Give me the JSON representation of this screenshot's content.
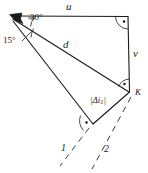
{
  "figure": {
    "background_color": "#ffffff",
    "ink_color": "#1a1a1a",
    "width": 148,
    "height": 173,
    "labels": {
      "u": "u",
      "v": "v",
      "d": "d",
      "K": "K",
      "angle_30": "30°",
      "angle_15": "15°",
      "delta_i": "|Δi",
      "delta_i_sub": "1",
      "delta_i_close": "|",
      "ray_1": "1",
      "ray_2": "2"
    },
    "markers": {
      "right_angle_top_right": "right-angle-arc-with-dot",
      "right_angle_at_K": "right-angle-arc-with-dot",
      "right_angle_bottom": "right-angle-arc-with-dot",
      "arrow_top_left": "arrowhead-pointing-up-left"
    },
    "geometry": {
      "apex_left": [
        11,
        16
      ],
      "corner_top_right": [
        128,
        17
      ],
      "vertex_K": [
        129,
        92
      ],
      "vertex_bottom": [
        92,
        123
      ],
      "angle_between_u_and_d": "30°",
      "angle_between_d_and_lower_ray": "15°"
    },
    "lines": [
      {
        "name": "u",
        "from": "apex_left",
        "to": "corner_top_right",
        "style": "solid"
      },
      {
        "name": "v",
        "from": "corner_top_right",
        "to": "vertex_K",
        "style": "solid"
      },
      {
        "name": "d",
        "from": "apex_left",
        "to": "vertex_K",
        "style": "solid"
      },
      {
        "name": "lower-ray",
        "from": "apex_left",
        "to": "vertex_bottom",
        "style": "solid"
      },
      {
        "name": "K-to-bottom",
        "from": "vertex_K",
        "to": "vertex_bottom",
        "style": "solid"
      },
      {
        "name": "ray-1",
        "style": "dashed"
      },
      {
        "name": "ray-2",
        "style": "dashed"
      }
    ]
  }
}
